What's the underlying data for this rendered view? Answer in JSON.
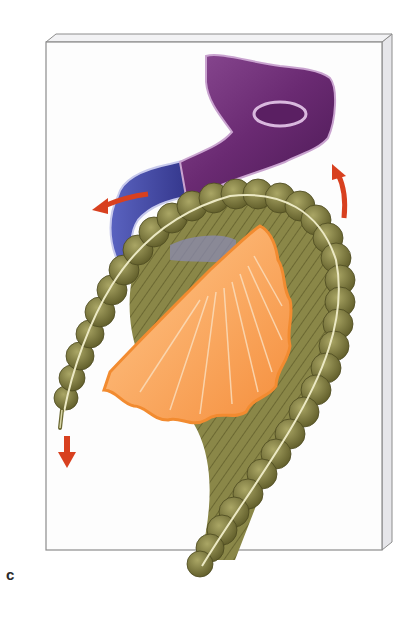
{
  "figure": {
    "panel_label": "c",
    "colors": {
      "board_face": "#fdfdfd",
      "board_edge": "#e6e6ea",
      "board_outline": "#8c8c8c",
      "stomach_purple": "#6a2a72",
      "stomach_highlight": "#b98fc0",
      "duodenum_blue": "#3d3f96",
      "colon_olive": "#7d7a3a",
      "colon_dark": "#5a5726",
      "colon_taenia": "#e8e6c2",
      "mesentery_orange": "#f7a35c",
      "mesentery_light": "#ffcf9a",
      "arrow_red": "#d8401f"
    },
    "arrows": [
      {
        "name": "left-rotation-arrow",
        "direction": "left"
      },
      {
        "name": "upward-rotation-arrow",
        "direction": "up"
      },
      {
        "name": "downward-arrow",
        "direction": "down"
      }
    ]
  }
}
